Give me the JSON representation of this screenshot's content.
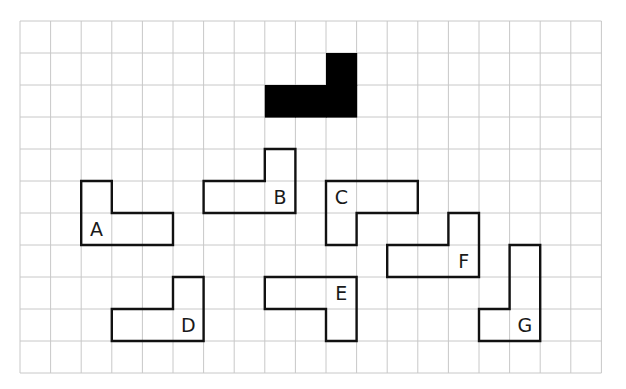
{
  "grid": {
    "columns": 19,
    "rows": 11,
    "origin_x": 20,
    "origin_y": 21,
    "cell_width": 30.6,
    "cell_height": 32,
    "line_color": "#c8c8c8",
    "background": "#ffffff"
  },
  "target_shape": {
    "name": "target",
    "fill": "#000000",
    "cells": [
      [
        10,
        1
      ],
      [
        8,
        2
      ],
      [
        9,
        2
      ],
      [
        10,
        2
      ]
    ]
  },
  "shapes": [
    {
      "label": "A",
      "cells": [
        [
          2,
          5
        ],
        [
          2,
          6
        ],
        [
          3,
          6
        ],
        [
          4,
          6
        ]
      ],
      "label_cell": [
        2,
        6
      ]
    },
    {
      "label": "B",
      "cells": [
        [
          8,
          4
        ],
        [
          6,
          5
        ],
        [
          7,
          5
        ],
        [
          8,
          5
        ]
      ],
      "label_cell": [
        8,
        5
      ]
    },
    {
      "label": "C",
      "cells": [
        [
          10,
          5
        ],
        [
          11,
          5
        ],
        [
          12,
          5
        ],
        [
          10,
          6
        ]
      ],
      "label_cell": [
        10,
        5
      ]
    },
    {
      "label": "D",
      "cells": [
        [
          5,
          8
        ],
        [
          3,
          9
        ],
        [
          4,
          9
        ],
        [
          5,
          9
        ]
      ],
      "label_cell": [
        5,
        9
      ]
    },
    {
      "label": "E",
      "cells": [
        [
          8,
          8
        ],
        [
          9,
          8
        ],
        [
          10,
          8
        ],
        [
          10,
          9
        ]
      ],
      "label_cell": [
        10,
        8
      ]
    },
    {
      "label": "F",
      "cells": [
        [
          14,
          6
        ],
        [
          12,
          7
        ],
        [
          13,
          7
        ],
        [
          14,
          7
        ]
      ],
      "label_cell": [
        14,
        7
      ]
    },
    {
      "label": "G",
      "cells": [
        [
          16,
          7
        ],
        [
          16,
          8
        ],
        [
          15,
          9
        ],
        [
          16,
          9
        ]
      ],
      "label_cell": [
        16,
        9
      ]
    }
  ],
  "outline_color": "#111111"
}
